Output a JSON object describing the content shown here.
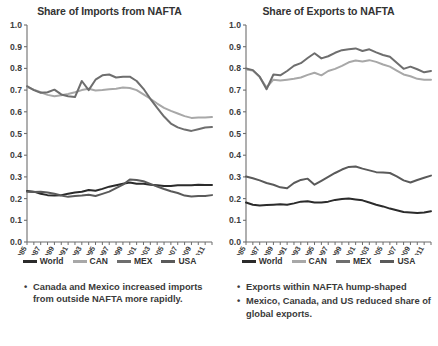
{
  "chart_data": [
    {
      "id": "imports",
      "type": "line",
      "title": "Share of Imports from NAFTA",
      "xlabel": "",
      "ylabel": "",
      "ylim": [
        0.0,
        1.0
      ],
      "yticks": [
        "0.0",
        "0.1",
        "0.2",
        "0.3",
        "0.4",
        "0.5",
        "0.6",
        "0.7",
        "0.8",
        "0.9",
        "1.0"
      ],
      "grid": false,
      "legend_position": "bottom",
      "x": [
        1985,
        1986,
        1987,
        1988,
        1989,
        1990,
        1991,
        1992,
        1993,
        1994,
        1995,
        1996,
        1997,
        1998,
        1999,
        2000,
        2001,
        2002,
        2003,
        2004,
        2005,
        2006,
        2007,
        2008,
        2009,
        2010,
        2011,
        2012
      ],
      "xticks": [
        "1985",
        "1987",
        "1989",
        "1991",
        "1993",
        "1995",
        "1997",
        "1999",
        "2001",
        "2003",
        "2005",
        "2007",
        "2009",
        "2011"
      ],
      "series": [
        {
          "name": "World",
          "color": "#2b2b2b",
          "values": [
            0.235,
            0.232,
            0.222,
            0.216,
            0.214,
            0.216,
            0.222,
            0.228,
            0.232,
            0.24,
            0.236,
            0.245,
            0.255,
            0.262,
            0.268,
            0.274,
            0.268,
            0.268,
            0.264,
            0.262,
            0.258,
            0.258,
            0.262,
            0.262,
            0.262,
            0.264,
            0.263,
            0.263
          ]
        },
        {
          "name": "CAN",
          "color": "#a8a8a8",
          "values": [
            0.715,
            0.702,
            0.69,
            0.678,
            0.672,
            0.676,
            0.682,
            0.69,
            0.7,
            0.706,
            0.698,
            0.7,
            0.704,
            0.706,
            0.712,
            0.71,
            0.7,
            0.68,
            0.66,
            0.638,
            0.618,
            0.604,
            0.592,
            0.58,
            0.572,
            0.574,
            0.574,
            0.576
          ]
        },
        {
          "name": "MEX",
          "color": "#6e6e6e",
          "values": [
            0.718,
            0.7,
            0.688,
            0.69,
            0.702,
            0.68,
            0.672,
            0.668,
            0.742,
            0.7,
            0.748,
            0.768,
            0.772,
            0.758,
            0.762,
            0.762,
            0.742,
            0.706,
            0.66,
            0.618,
            0.578,
            0.546,
            0.528,
            0.518,
            0.512,
            0.52,
            0.528,
            0.53
          ]
        },
        {
          "name": "USA",
          "color": "#5a5a5a",
          "values": [
            0.232,
            0.23,
            0.232,
            0.228,
            0.222,
            0.214,
            0.208,
            0.212,
            0.214,
            0.218,
            0.212,
            0.222,
            0.232,
            0.248,
            0.264,
            0.288,
            0.286,
            0.28,
            0.268,
            0.256,
            0.244,
            0.234,
            0.226,
            0.214,
            0.21,
            0.212,
            0.212,
            0.216
          ]
        }
      ],
      "caption_bullets": [
        "Canada and Mexico increased imports from outside NAFTA more rapidly."
      ]
    },
    {
      "id": "exports",
      "type": "line",
      "title": "Share of Exports to NAFTA",
      "xlabel": "",
      "ylabel": "",
      "ylim": [
        0.0,
        1.0
      ],
      "yticks": [
        "0.0",
        "0.1",
        "0.2",
        "0.3",
        "0.4",
        "0.5",
        "0.6",
        "0.7",
        "0.8",
        "0.9",
        "1.0"
      ],
      "grid": false,
      "legend_position": "bottom",
      "x": [
        1985,
        1986,
        1987,
        1988,
        1989,
        1990,
        1991,
        1992,
        1993,
        1994,
        1995,
        1996,
        1997,
        1998,
        1999,
        2000,
        2001,
        2002,
        2003,
        2004,
        2005,
        2006,
        2007,
        2008,
        2009,
        2010,
        2011,
        2012
      ],
      "xticks": [
        "1985",
        "1987",
        "1989",
        "1991",
        "1993",
        "1995",
        "1997",
        "1999",
        "2001",
        "2003",
        "2005",
        "2007",
        "2009",
        "2011"
      ],
      "series": [
        {
          "name": "World",
          "color": "#2b2b2b",
          "values": [
            0.182,
            0.172,
            0.168,
            0.17,
            0.172,
            0.174,
            0.172,
            0.178,
            0.186,
            0.188,
            0.182,
            0.182,
            0.186,
            0.194,
            0.198,
            0.2,
            0.196,
            0.192,
            0.182,
            0.172,
            0.164,
            0.154,
            0.146,
            0.138,
            0.136,
            0.134,
            0.136,
            0.142
          ]
        },
        {
          "name": "CAN",
          "color": "#a8a8a8",
          "values": [
            0.795,
            0.79,
            0.76,
            0.712,
            0.748,
            0.744,
            0.748,
            0.752,
            0.758,
            0.77,
            0.78,
            0.768,
            0.788,
            0.798,
            0.812,
            0.828,
            0.836,
            0.832,
            0.838,
            0.83,
            0.818,
            0.808,
            0.79,
            0.772,
            0.764,
            0.752,
            0.748,
            0.748
          ]
        },
        {
          "name": "MEX",
          "color": "#6e6e6e",
          "values": [
            0.8,
            0.792,
            0.762,
            0.704,
            0.772,
            0.768,
            0.788,
            0.812,
            0.824,
            0.848,
            0.87,
            0.846,
            0.856,
            0.872,
            0.884,
            0.888,
            0.892,
            0.88,
            0.888,
            0.874,
            0.862,
            0.854,
            0.826,
            0.798,
            0.808,
            0.796,
            0.782,
            0.788
          ]
        },
        {
          "name": "USA",
          "color": "#5a5a5a",
          "values": [
            0.302,
            0.294,
            0.284,
            0.272,
            0.264,
            0.252,
            0.248,
            0.272,
            0.286,
            0.292,
            0.264,
            0.282,
            0.3,
            0.318,
            0.334,
            0.346,
            0.348,
            0.338,
            0.33,
            0.322,
            0.32,
            0.318,
            0.302,
            0.284,
            0.274,
            0.286,
            0.296,
            0.306
          ]
        }
      ],
      "caption_bullets": [
        "Exports within NAFTA hump-shaped",
        "Mexico, Canada, and US reduced share of global exports."
      ]
    }
  ]
}
